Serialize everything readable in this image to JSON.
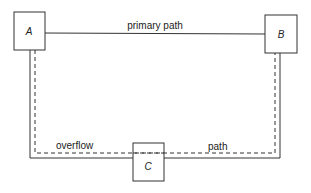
{
  "nodes": [
    {
      "id": "A",
      "label": "A"
    },
    {
      "id": "B",
      "label": "B"
    },
    {
      "id": "C",
      "label": "C"
    }
  ],
  "edges": {
    "primary": {
      "label": "primary path",
      "style": "solid",
      "from": "A",
      "to": "B"
    },
    "overflow": {
      "label_left": "overflow",
      "label_right": "path",
      "style": "dashed",
      "via": "C"
    }
  },
  "colors": {
    "stroke": "#333333",
    "background": "#ffffff"
  }
}
